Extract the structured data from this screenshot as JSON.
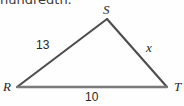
{
  "figure": {
    "instruction_fragment": "hundredth.",
    "background_color": "#fefefe",
    "stroke_color": "#4d4d4d",
    "label_color": "#262626"
  },
  "triangle": {
    "name": "RST",
    "vertices": [
      {
        "id": "S",
        "label": "S",
        "x": 107,
        "y": 19
      },
      {
        "id": "R",
        "label": "R",
        "x": 17,
        "y": 87
      },
      {
        "id": "T",
        "label": "T",
        "x": 167,
        "y": 87
      }
    ],
    "sides": [
      {
        "id": "RS",
        "label": "13",
        "from": "R",
        "to": "S",
        "is_variable": false
      },
      {
        "id": "ST",
        "label": "x",
        "from": "S",
        "to": "T",
        "is_variable": true
      },
      {
        "id": "RT",
        "label": "10",
        "from": "R",
        "to": "T",
        "is_variable": false
      }
    ]
  }
}
